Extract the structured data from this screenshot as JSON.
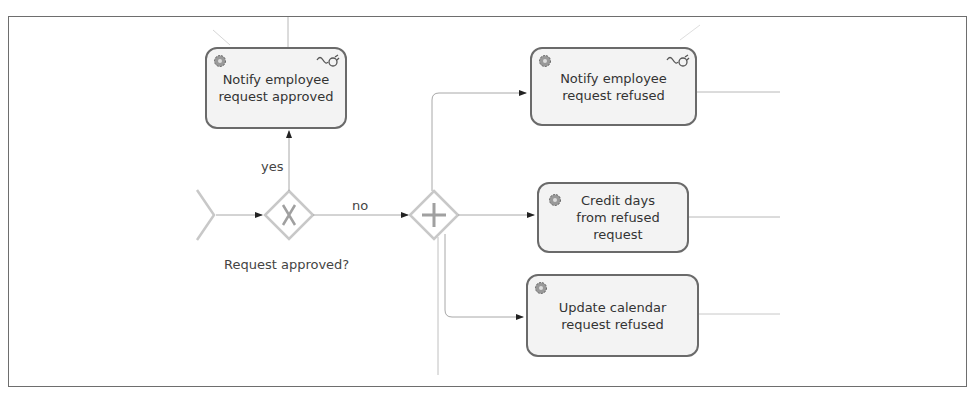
{
  "diagram": {
    "type": "bpmn-process-fragment",
    "tasks": [
      {
        "id": "t1",
        "label_line1": "Notify employee",
        "label_line2": "request approved",
        "icon": "gear-icon",
        "connector_icon": "plug-icon"
      },
      {
        "id": "t2",
        "label_line1": "Notify employee",
        "label_line2": "request refused",
        "icon": "gear-icon",
        "connector_icon": "plug-icon"
      },
      {
        "id": "t3",
        "label_line1": "Credit days",
        "label_line2": "from refused",
        "label_line3": "request",
        "icon": "gear-icon"
      },
      {
        "id": "t4",
        "label_line1": "Update calendar",
        "label_line2": "request refused",
        "icon": "gear-icon"
      }
    ],
    "gateways": [
      {
        "id": "g1",
        "type": "exclusive",
        "symbol": "X",
        "label": "Request approved?"
      },
      {
        "id": "g2",
        "type": "parallel",
        "symbol": "+"
      }
    ],
    "flows": [
      {
        "from": "g1",
        "to": "t1",
        "label": "yes"
      },
      {
        "from": "g1",
        "to": "g2",
        "label": "no"
      },
      {
        "from": "g2",
        "to": "t2",
        "label": ""
      },
      {
        "from": "g2",
        "to": "t3",
        "label": ""
      },
      {
        "from": "g2",
        "to": "t4",
        "label": ""
      }
    ],
    "colors": {
      "task_fill": "#f3f3f3",
      "task_border": "#6a6a6a",
      "gateway_border": "#c8c8c8",
      "flow_line": "#a8a8a8",
      "text": "#333333"
    }
  }
}
